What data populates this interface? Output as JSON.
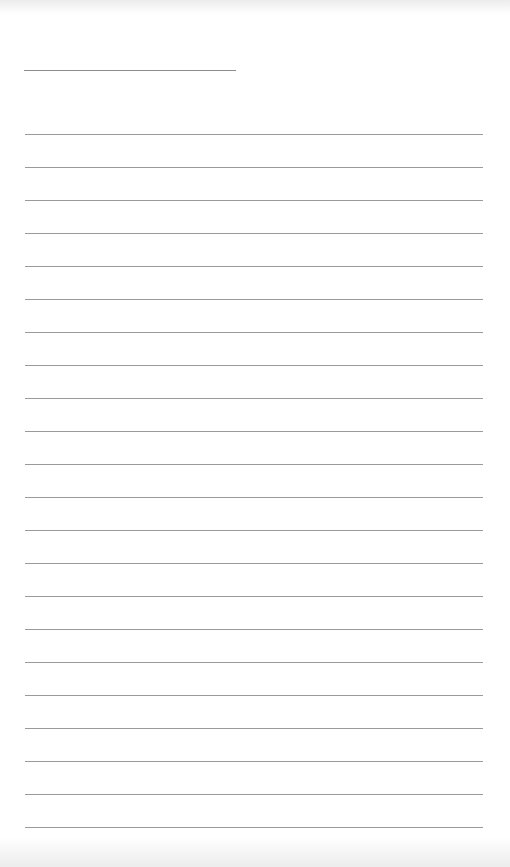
{
  "page": {
    "type": "lined-paper",
    "background": "#ffffff",
    "line_color": "#9a9a9a"
  },
  "header_field": {
    "x_start": 24,
    "x_end": 236,
    "y": 70,
    "text": ""
  },
  "ruled_lines": {
    "count": 22,
    "x_start": 25,
    "x_end": 483,
    "first_y": 134,
    "spacing": 33,
    "text": ""
  }
}
